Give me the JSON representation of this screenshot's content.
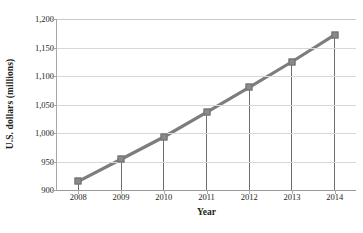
{
  "chart_data": {
    "type": "line",
    "title": "",
    "xlabel": "Year",
    "ylabel": "U.S. dollars (millions)",
    "categories": [
      "2008",
      "2009",
      "2010",
      "2011",
      "2012",
      "2013",
      "2014"
    ],
    "values": [
      915,
      954,
      993,
      1036,
      1080,
      1125,
      1172
    ],
    "series": [
      {
        "name": "U.S. dollars (millions)",
        "values": [
          915,
          954,
          993,
          1036,
          1080,
          1125,
          1172
        ]
      }
    ],
    "ylim": [
      900,
      1200
    ],
    "yticks": [
      900,
      950,
      1000,
      1050,
      1100,
      1150,
      1200
    ],
    "ytick_labels": [
      "900",
      "950",
      "1,000",
      "1,050",
      "1,100",
      "1,150",
      "1,200"
    ],
    "xtick_labels": [
      "2008",
      "2009",
      "2010",
      "2011",
      "2012",
      "2013",
      "2014"
    ],
    "grid": true,
    "legend": false,
    "legend_position": "none",
    "marker": "square",
    "drop_lines": true,
    "colors": {
      "line": "#7d7d7d",
      "marker_fill": "#8a8a8a",
      "marker_edge": "#6f6f6f",
      "gridline": "#d7d7d7",
      "axis": "#a6a6a6",
      "dropline": "#6d6d6d",
      "text": "#231f20",
      "background": "#ffffff"
    }
  }
}
